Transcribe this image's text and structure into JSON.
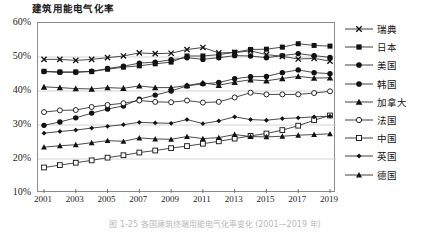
{
  "chart_data": {
    "type": "line",
    "title": "建筑用能电气化率",
    "xlabel": "",
    "ylabel": "",
    "x": [
      2001,
      2002,
      2003,
      2004,
      2005,
      2006,
      2007,
      2008,
      2009,
      2010,
      2011,
      2012,
      2013,
      2014,
      2015,
      2016,
      2017,
      2018,
      2019
    ],
    "tick_labels": [
      "2001",
      "2003",
      "2005",
      "2007",
      "2009",
      "2011",
      "2013",
      "2015",
      "2017",
      "2019"
    ],
    "ytick_labels": [
      "10%",
      "20%",
      "30%",
      "40%",
      "50%",
      "60%"
    ],
    "ylim": [
      10,
      60
    ],
    "xlim": [
      2001,
      2019
    ],
    "grid": true,
    "legend_position": "right",
    "series": [
      {
        "name": "瑞典",
        "marker": "cross",
        "values": [
          49.3,
          49.3,
          49.0,
          49.3,
          49.8,
          50.3,
          51.2,
          51.0,
          51.1,
          52.2,
          52.8,
          51.2,
          51.3,
          51.8,
          50.7,
          50.2,
          49.4,
          49.6,
          48.8
        ]
      },
      {
        "name": "日本",
        "marker": "filled-square",
        "values": [
          45.8,
          45.6,
          45.6,
          45.7,
          46.4,
          47.0,
          47.4,
          48.0,
          48.5,
          50.3,
          50.3,
          50.7,
          51.4,
          52.2,
          52.3,
          52.9,
          53.9,
          53.4,
          53.2
        ]
      },
      {
        "name": "美国",
        "marker": "filled-circle",
        "values": [
          45.7,
          45.5,
          45.5,
          45.8,
          46.6,
          47.3,
          48.2,
          48.5,
          49.2,
          49.8,
          49.3,
          49.8,
          50.4,
          50.3,
          49.8,
          50.4,
          51.0,
          50.4,
          49.9
        ]
      },
      {
        "name": "韩国",
        "marker": "filled-circle",
        "values": [
          29.9,
          30.9,
          32.1,
          33.5,
          34.7,
          35.6,
          37.6,
          38.8,
          40.0,
          41.5,
          42.1,
          42.5,
          43.6,
          44.2,
          44.3,
          45.4,
          46.2,
          45.4,
          45.1
        ]
      },
      {
        "name": "加拿大",
        "marker": "filled-triangle",
        "values": [
          41.2,
          41.0,
          40.7,
          40.6,
          41.0,
          40.8,
          41.5,
          41.0,
          41.0,
          41.6,
          42.4,
          41.7,
          42.6,
          43.3,
          43.0,
          43.7,
          44.3,
          43.8,
          43.9
        ]
      },
      {
        "name": "法国",
        "marker": "open-circle",
        "values": [
          33.8,
          34.3,
          34.4,
          35.3,
          35.9,
          36.4,
          37.2,
          36.8,
          36.7,
          37.2,
          36.6,
          36.8,
          38.1,
          39.5,
          39.0,
          39.0,
          39.0,
          39.4,
          39.9
        ]
      },
      {
        "name": "中国",
        "marker": "open-square",
        "values": [
          17.5,
          18.2,
          18.9,
          19.6,
          20.4,
          21.1,
          21.9,
          22.5,
          23.2,
          23.8,
          24.5,
          25.2,
          26.0,
          26.8,
          27.5,
          28.5,
          29.8,
          31.4,
          32.8
        ]
      },
      {
        "name": "英国",
        "marker": "small-diamond",
        "values": [
          27.6,
          28.1,
          28.5,
          29.1,
          29.6,
          30.1,
          30.8,
          30.6,
          30.5,
          31.6,
          30.4,
          31.2,
          32.4,
          31.6,
          31.4,
          31.9,
          32.1,
          32.4,
          32.6
        ]
      },
      {
        "name": "德国",
        "marker": "filled-triangle-small",
        "values": [
          23.5,
          23.9,
          24.2,
          24.8,
          25.4,
          25.2,
          26.2,
          25.9,
          25.8,
          26.6,
          26.0,
          26.3,
          27.2,
          26.6,
          26.5,
          26.7,
          27.0,
          27.2,
          27.4
        ]
      }
    ]
  },
  "caption": "图 1-25  各国建筑终端用能电气化率变化  (2001—2019 年)"
}
